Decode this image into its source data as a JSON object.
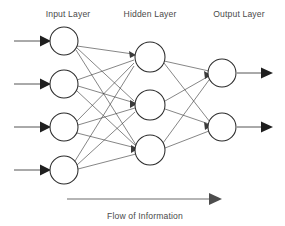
{
  "diagram": {
    "type": "feedforward-neural-network",
    "background_color": "#ffffff",
    "node_stroke_color": "#2b2b2b",
    "edge_color": "#3b3b3b",
    "text_color": "#4a4a4a",
    "labels": {
      "input_layer": "Input Layer",
      "hidden_layer": "Hidden Layer",
      "output_layer": "Output Layer"
    },
    "caption": "Flow of Information",
    "layers": [
      {
        "name": "Input Layer",
        "node_count": 4,
        "nodes": [
          {
            "id": "i1",
            "cx": 64,
            "cy": 41,
            "r": 14
          },
          {
            "id": "i2",
            "cx": 64,
            "cy": 84,
            "r": 14
          },
          {
            "id": "i3",
            "cx": 64,
            "cy": 127,
            "r": 14
          },
          {
            "id": "i4",
            "cx": 64,
            "cy": 170,
            "r": 14
          }
        ]
      },
      {
        "name": "Hidden Layer",
        "node_count": 3,
        "nodes": [
          {
            "id": "h1",
            "cx": 150,
            "cy": 57,
            "r": 15
          },
          {
            "id": "h2",
            "cx": 150,
            "cy": 105,
            "r": 15
          },
          {
            "id": "h3",
            "cx": 150,
            "cy": 150,
            "r": 15
          }
        ]
      },
      {
        "name": "Output Layer",
        "node_count": 2,
        "nodes": [
          {
            "id": "o1",
            "cx": 222,
            "cy": 73,
            "r": 14
          },
          {
            "id": "o2",
            "cx": 222,
            "cy": 127,
            "r": 14
          }
        ]
      }
    ],
    "input_arrows": [
      {
        "id": "in-arrow-1",
        "x1": 14,
        "y1": 41,
        "x2": 48,
        "y2": 41
      },
      {
        "id": "in-arrow-2",
        "x1": 14,
        "y1": 84,
        "x2": 48,
        "y2": 84
      },
      {
        "id": "in-arrow-3",
        "x1": 14,
        "y1": 127,
        "x2": 48,
        "y2": 127
      },
      {
        "id": "in-arrow-4",
        "x1": 14,
        "y1": 170,
        "x2": 48,
        "y2": 170
      }
    ],
    "output_arrows": [
      {
        "id": "out-arrow-1",
        "x1": 237,
        "y1": 73,
        "x2": 272,
        "y2": 73
      },
      {
        "id": "out-arrow-2",
        "x1": 237,
        "y1": 127,
        "x2": 272,
        "y2": 127
      }
    ],
    "flow_arrow": {
      "x1": 67,
      "y1": 199,
      "x2": 221,
      "y2": 199
    },
    "label_positions": {
      "input_layer": {
        "x": 68,
        "y": 17
      },
      "hidden_layer": {
        "x": 150,
        "y": 17
      },
      "output_layer": {
        "x": 239,
        "y": 17
      },
      "caption": {
        "x": 145,
        "y": 219
      }
    },
    "connections": {
      "input_to_hidden_count": 12,
      "hidden_to_output_count": 6,
      "fully_connected": true
    }
  }
}
